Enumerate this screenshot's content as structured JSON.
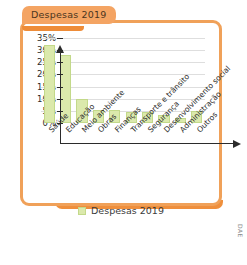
{
  "title": "Despesas 2019",
  "credit": "DAE",
  "legend": {
    "label": "Despesas 2019",
    "swatch_color": "#dbe9ac"
  },
  "colors": {
    "frame": "#f0a159",
    "tab": "#f4a463",
    "tab_shadow": "#ee8c38",
    "bar_fill": "#dbe9ac",
    "bar_stroke": "#c3d98a",
    "grid": "#dedede",
    "axis": "#2b2b2b"
  },
  "chart_data": {
    "type": "bar",
    "title": "Despesas 2019",
    "xlabel": "",
    "ylabel": "",
    "ylim": [
      0,
      35
    ],
    "ytick_labels": [
      "35%",
      "30%",
      "25%",
      "20%",
      "15%",
      "10%",
      "5%",
      "0%"
    ],
    "ytick_values": [
      35,
      30,
      25,
      20,
      15,
      10,
      5,
      0
    ],
    "grid": true,
    "legend_position": "bottom",
    "categories": [
      "Saúde",
      "Educação",
      "Meio ambiente",
      "Obras",
      "Finanças",
      "Transporte e trânsito",
      "Segurança",
      "Desenvolvimento social",
      "Administração",
      "Outros"
    ],
    "series": [
      {
        "name": "Despesas 2019",
        "values": [
          32,
          28,
          10,
          5.5,
          5.5,
          4.5,
          4.5,
          3.5,
          2,
          5
        ]
      }
    ]
  }
}
